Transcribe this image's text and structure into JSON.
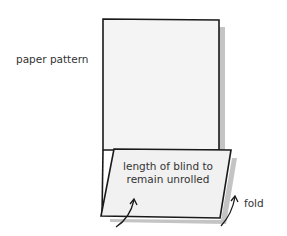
{
  "labels": {
    "paper_pattern": "paper pattern",
    "flap_line1": "length of blind to",
    "flap_line2": "remain unrolled",
    "fold": "fold"
  },
  "colors": {
    "paper": "#f3f3f3",
    "outline": "#1a1a1a",
    "shadow": "#bdbdbd",
    "text": "#333333"
  }
}
